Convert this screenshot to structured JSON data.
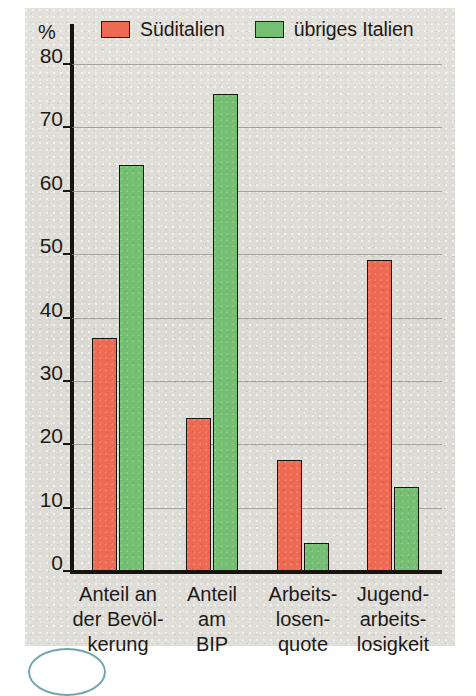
{
  "chart_data": {
    "type": "bar",
    "title": "",
    "xlabel": "",
    "ylabel": "%",
    "ylim": [
      0,
      80
    ],
    "yticks": [
      0,
      10,
      20,
      30,
      40,
      50,
      60,
      70,
      80
    ],
    "grid": true,
    "legend_position": "top",
    "categories": [
      "Anteil an\nder Bevöl-\nkerung",
      "Anteil\nam\nBIP",
      "Arbeits-\nlosen-\nquote",
      "Jugend-\narbeits-\nlosigkeit"
    ],
    "series": [
      {
        "name": "Süditalien",
        "color": "#ee6a52",
        "values": [
          36.7,
          24.1,
          17.5,
          49.0
        ]
      },
      {
        "name": "übriges Italien",
        "color": "#74bf72",
        "values": [
          64.0,
          75.2,
          4.4,
          13.2
        ]
      }
    ]
  },
  "axis": {
    "unit_symbol": "%",
    "tick_labels": [
      "80",
      "70",
      "60",
      "50",
      "40",
      "30",
      "20",
      "10",
      "0"
    ]
  },
  "legend": {
    "entries": [
      {
        "label": "Süditalien",
        "color": "#ee6a52"
      },
      {
        "label": "übriges Italien",
        "color": "#74bf72"
      }
    ]
  },
  "colors": {
    "south_italy": "#ee6a52",
    "rest_italy": "#74bf72",
    "panel_background": "#dedcd6",
    "axis": "#17140f",
    "gridline": "#8d8d8a",
    "text": "#1d1a17",
    "corner_accent": "#6fa9ad"
  }
}
